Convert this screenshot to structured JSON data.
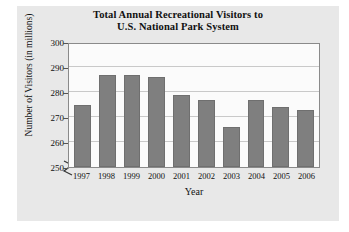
{
  "chart_data": {
    "type": "bar",
    "title": "Total Annual Recreational Visitors to U.S. National Park System",
    "title_lines": [
      "Total Annual Recreational Visitors to",
      "U.S. National Park System"
    ],
    "xlabel": "Year",
    "ylabel": "Number of Visitors (in millions)",
    "categories": [
      "1997",
      "1998",
      "1999",
      "2000",
      "2001",
      "2002",
      "2003",
      "2004",
      "2005",
      "2006"
    ],
    "values": [
      275,
      287,
      287,
      286,
      279,
      277,
      266,
      277,
      274,
      273
    ],
    "ylim": [
      250,
      300
    ],
    "yticks": [
      250,
      260,
      270,
      280,
      290,
      300
    ],
    "ytick_labels": [
      "250",
      "260",
      "270",
      "280",
      "290",
      "300"
    ],
    "grid": true,
    "legend": false,
    "axis_break": true,
    "axis_break_symbol": "zigzag",
    "bar_color": "#7f7f7f",
    "plot_background": "#fbfbfb",
    "figure_background": "#e8e8e8",
    "grid_color": "#c9c9c9",
    "axis_color": "#8a8a8a",
    "text_color": "#111111"
  }
}
